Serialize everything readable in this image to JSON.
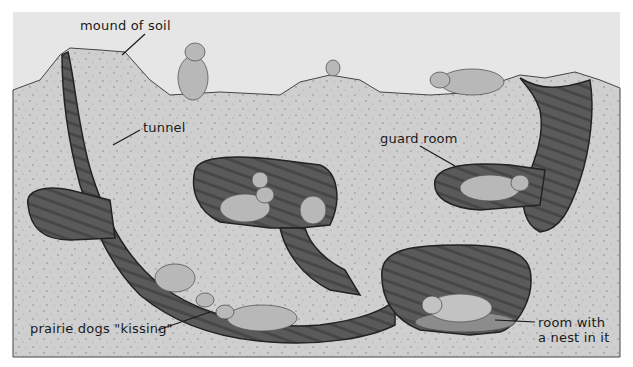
{
  "diagram": {
    "labels": [
      {
        "id": "mound",
        "text": "mound of soil"
      },
      {
        "id": "tunnel",
        "text": "tunnel"
      },
      {
        "id": "guard",
        "text": "guard room"
      },
      {
        "id": "kissing",
        "text": "prairie dogs \"kissing\""
      },
      {
        "id": "nest_line1",
        "text": "room with"
      },
      {
        "id": "nest_line2",
        "text": "a nest in it"
      }
    ]
  },
  "colors": {
    "sky": "#e6e6e6",
    "soil": "#c9c9c9",
    "tunnel": "#5a5a5a",
    "tunnel_dark": "#2e2e2e",
    "animal": "#b5b5b5",
    "line": "#1a1a1a"
  }
}
